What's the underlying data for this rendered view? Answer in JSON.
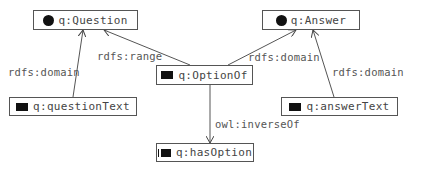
{
  "diagram": {
    "nodes": [
      {
        "id": "question",
        "label": "q:Question",
        "icon": "class-circle-icon"
      },
      {
        "id": "answer",
        "label": "q:Answer",
        "icon": "class-circle-icon"
      },
      {
        "id": "optionOf",
        "label": "q:OptionOf",
        "icon": "property-rect-icon"
      },
      {
        "id": "questionText",
        "label": "q:questionText",
        "icon": "property-rect-icon"
      },
      {
        "id": "answerText",
        "label": "q:answerText",
        "icon": "property-rect-icon"
      },
      {
        "id": "hasOption",
        "label": "q:hasOption",
        "icon": "property-rect-icon"
      }
    ],
    "edges": [
      {
        "from": "optionOf",
        "to": "question",
        "label": "rdfs:range"
      },
      {
        "from": "questionText",
        "to": "question",
        "label": "rdfs:domain"
      },
      {
        "from": "optionOf",
        "to": "answer",
        "label": "rdfs:domain"
      },
      {
        "from": "answerText",
        "to": "answer",
        "label": "rdfs:domain"
      },
      {
        "from": "optionOf",
        "to": "hasOption",
        "label": "owl:inverseOf"
      }
    ]
  }
}
